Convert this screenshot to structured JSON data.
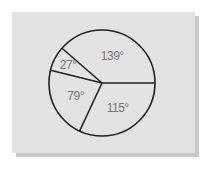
{
  "chart_data": {
    "type": "pie",
    "title": "",
    "unit": "degrees",
    "slices": [
      {
        "label": "139°",
        "value": 139
      },
      {
        "label": "27°",
        "value": 27
      },
      {
        "label": "79°",
        "value": 79
      },
      {
        "label": "115°",
        "value": 115
      }
    ],
    "start_angle_deg": 0,
    "direction": "counterclockwise",
    "total": 360
  },
  "colors": {
    "background": "#e3e3e3",
    "stroke": "#222222",
    "label": "#777777"
  }
}
